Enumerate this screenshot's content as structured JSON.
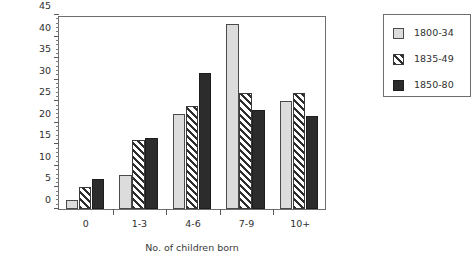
{
  "chart_data": {
    "type": "bar",
    "title": "",
    "subtitle": "",
    "xlabel": "No. of children born",
    "ylabel": "Percentage of families",
    "categories": [
      "0",
      "1-3",
      "4-6",
      "7-9",
      "10+"
    ],
    "series": [
      {
        "name": "1800-34",
        "pattern": "dotted-light",
        "color": "#dcdcdc",
        "values": [
          2,
          8,
          22,
          43,
          25
        ]
      },
      {
        "name": "1835-49",
        "pattern": "diagonal-hatch",
        "color": "#ffffff",
        "values": [
          5,
          16,
          24,
          27,
          27
        ]
      },
      {
        "name": "1850-80",
        "pattern": "solid-dark",
        "color": "#2c2c2c",
        "values": [
          7,
          16.5,
          31.5,
          23,
          21.5
        ]
      }
    ],
    "ylim": [
      0,
      45
    ],
    "ytick_values": [
      0,
      5,
      10,
      15,
      20,
      25,
      30,
      35,
      40,
      45
    ],
    "ytick_labels": [
      "0",
      "5",
      "10",
      "15",
      "20",
      "25",
      "30",
      "35",
      "40",
      "45"
    ],
    "yminor_step": 1,
    "grid": false,
    "legend_position": "right-outside",
    "frame": true
  }
}
